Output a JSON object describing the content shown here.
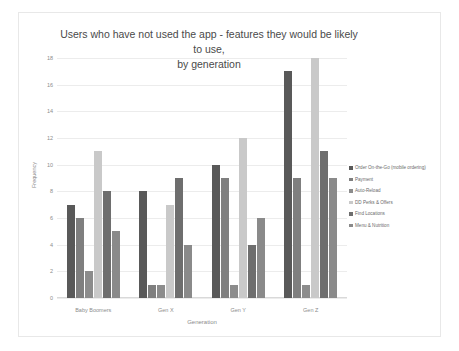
{
  "chart_data": {
    "type": "bar",
    "title": "Users who have not used the app - features they would be likely to use, by generation",
    "title_line1": "Users who have not used the app - features they would be likely to use,",
    "title_line2": "by generation",
    "xlabel": "Generation",
    "ylabel": "Frequency",
    "ylim": [
      0,
      18
    ],
    "yticks": [
      18,
      16,
      14,
      12,
      10,
      8,
      6,
      4,
      2,
      0
    ],
    "grid": true,
    "legend_position": "right",
    "categories": [
      "Baby Boomers",
      "Gen X",
      "Gen Y",
      "Gen Z"
    ],
    "series": [
      {
        "name": "Order On-the-Go (mobile ordering)",
        "color": "#595959",
        "values": [
          7,
          8,
          10,
          17
        ]
      },
      {
        "name": "Payment",
        "color": "#7f7f7f",
        "values": [
          6,
          1,
          9,
          9
        ]
      },
      {
        "name": "Auto-Reload",
        "color": "#8c8c8c",
        "values": [
          2,
          1,
          1,
          1
        ]
      },
      {
        "name": "DD Perks & Offers",
        "color": "#c9c9c9",
        "values": [
          11,
          7,
          12,
          18
        ]
      },
      {
        "name": "Find Locations",
        "color": "#6e6e6e",
        "values": [
          8,
          9,
          4,
          11
        ]
      },
      {
        "name": "Menu & Nutrition",
        "color": "#8a8a8a",
        "values": [
          5,
          4,
          6,
          9
        ]
      }
    ]
  }
}
